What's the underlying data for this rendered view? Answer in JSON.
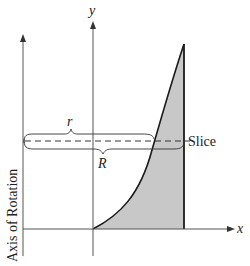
{
  "diagram": {
    "labels": {
      "y_axis": "y",
      "x_axis": "x",
      "axis_of_rotation": "Axis of Rotation",
      "inner_radius": "r",
      "outer_radius": "R",
      "slice": "Slice"
    },
    "colors": {
      "line": "#333333",
      "axis": "#555555",
      "region_fill": "#c8c8c8",
      "curve": "#1a1a1a",
      "background": "#ffffff"
    }
  }
}
